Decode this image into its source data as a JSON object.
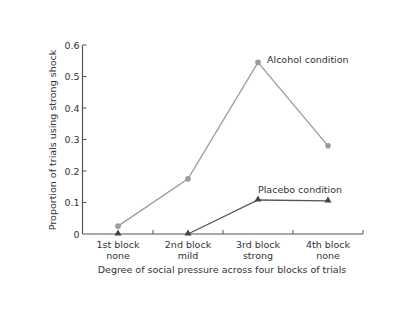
{
  "chart_data": {
    "type": "line",
    "title": "",
    "xlabel": "Degree of social pressure across four blocks of trials",
    "ylabel": "Proportion of trials using strong shock",
    "ylim": [
      0,
      0.6
    ],
    "yticks": [
      "0",
      "0.1",
      "0.2",
      "0.3",
      "0.4",
      "0.5",
      "0.6"
    ],
    "categories": [
      {
        "line1": "1st block",
        "line2": "none"
      },
      {
        "line1": "2nd block",
        "line2": "mild"
      },
      {
        "line1": "3rd block",
        "line2": "strong"
      },
      {
        "line1": "4th block",
        "line2": "none"
      }
    ],
    "series": [
      {
        "name": "Alcohol condition",
        "marker": "circle",
        "color": "#9b9b9b",
        "values": [
          0.025,
          0.175,
          0.545,
          0.28
        ]
      },
      {
        "name": "Placebo condition",
        "marker": "triangle",
        "color": "#555555",
        "values": [
          0,
          0,
          0.108,
          0.105
        ]
      }
    ],
    "annotations": [
      "Alcohol condition",
      "Placebo condition"
    ],
    "grid": false,
    "legend": "inline annotations"
  }
}
